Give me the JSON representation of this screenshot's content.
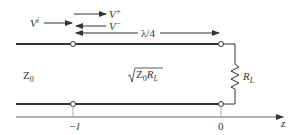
{
  "diagram": {
    "labels": {
      "incident_wave": "V",
      "incident_sup": "i",
      "forward_wave": "V",
      "forward_sup": "+",
      "backward_wave": "V",
      "backward_sup": "−",
      "section_length": "λ/4",
      "line_impedance": "Z",
      "line_impedance_sub": "0",
      "transformer_impedance_prefix": "Z",
      "transformer_impedance_sub0": "0",
      "transformer_impedance_R": "R",
      "transformer_impedance_subL": "L",
      "load_R": "R",
      "load_sub": "L",
      "tick_minus_l": "−l",
      "tick_zero": "0",
      "axis_label": "z"
    },
    "colors": {
      "line": "#333333",
      "axis": "#666666",
      "text": "#333333"
    }
  }
}
